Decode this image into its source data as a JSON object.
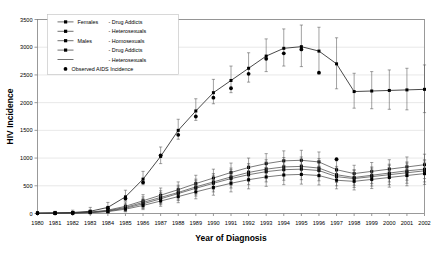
{
  "chart_data": {
    "type": "line",
    "title": "",
    "xlabel": "Year of Diagnosis",
    "ylabel": "HIV Incidence",
    "xlim": [
      1980,
      2002
    ],
    "ylim": [
      0,
      3500
    ],
    "ytick_labels": [
      "0",
      "500",
      "1000",
      "1500",
      "2000",
      "2500",
      "3000",
      "3500"
    ],
    "yticks": [
      0,
      500,
      1000,
      1500,
      2000,
      2500,
      3000,
      3500
    ],
    "grid": true,
    "legend_position": "top-left",
    "categories": [
      1980,
      1981,
      1982,
      1983,
      1984,
      1985,
      1986,
      1987,
      1988,
      1989,
      1990,
      1991,
      1992,
      1993,
      1994,
      1995,
      1996,
      1997,
      1998,
      1999,
      2000,
      2001,
      2002
    ],
    "series": [
      {
        "name": "Females - Drug Addicts",
        "marker": "filled-square",
        "values": [
          5,
          8,
          12,
          25,
          60,
          130,
          230,
          330,
          430,
          540,
          640,
          740,
          830,
          900,
          950,
          960,
          930,
          790,
          720,
          760,
          800,
          840,
          880
        ],
        "err_low": [
          0,
          0,
          0,
          0,
          20,
          55,
          120,
          210,
          300,
          400,
          490,
          580,
          660,
          730,
          780,
          790,
          760,
          640,
          580,
          610,
          640,
          670,
          700
        ],
        "err_high": [
          20,
          25,
          35,
          60,
          110,
          210,
          340,
          460,
          570,
          690,
          800,
          910,
          1000,
          1080,
          1130,
          1140,
          1110,
          950,
          870,
          920,
          970,
          1020,
          1070
        ]
      },
      {
        "name": "Females - Heterosexuals",
        "marker": "filled-square",
        "values": [
          4,
          7,
          10,
          20,
          50,
          110,
          200,
          290,
          380,
          480,
          570,
          660,
          740,
          800,
          840,
          850,
          820,
          700,
          650,
          690,
          730,
          770,
          800
        ],
        "err_low": [
          0,
          0,
          0,
          0,
          15,
          45,
          105,
          180,
          260,
          350,
          430,
          510,
          580,
          640,
          680,
          690,
          660,
          560,
          510,
          540,
          570,
          600,
          630
        ],
        "err_high": [
          18,
          22,
          30,
          52,
          95,
          185,
          300,
          410,
          510,
          620,
          720,
          820,
          900,
          970,
          1010,
          1020,
          990,
          850,
          790,
          840,
          890,
          930,
          970
        ]
      },
      {
        "name": "Males - Homosexuals",
        "marker": "filled-square",
        "values": [
          6,
          10,
          18,
          40,
          110,
          300,
          620,
          1030,
          1500,
          1850,
          2180,
          2400,
          2620,
          2840,
          2980,
          3010,
          2930,
          2700,
          2200,
          2210,
          2220,
          2230,
          2240
        ],
        "err_low": [
          0,
          0,
          0,
          10,
          70,
          230,
          520,
          900,
          1340,
          1680,
          1980,
          2180,
          2370,
          2560,
          2660,
          2650,
          2520,
          2250,
          1900,
          1890,
          1880,
          1870,
          1820
        ],
        "err_high": [
          30,
          40,
          60,
          110,
          200,
          420,
          760,
          1200,
          1700,
          2070,
          2420,
          2660,
          2900,
          3150,
          3330,
          3400,
          3360,
          3170,
          2530,
          2560,
          2590,
          2620,
          2680
        ]
      },
      {
        "name": "Males - Drug Addicts",
        "marker": "filled-square",
        "values": [
          3,
          5,
          9,
          18,
          42,
          95,
          175,
          265,
          360,
          455,
          545,
          630,
          700,
          755,
          790,
          800,
          775,
          665,
          630,
          665,
          700,
          735,
          770
        ],
        "err_low": [
          0,
          0,
          0,
          0,
          12,
          40,
          90,
          160,
          235,
          315,
          390,
          460,
          520,
          570,
          600,
          610,
          590,
          500,
          470,
          495,
          520,
          545,
          570
        ],
        "err_high": [
          15,
          20,
          28,
          45,
          85,
          160,
          265,
          375,
          480,
          590,
          690,
          790,
          870,
          930,
          970,
          980,
          950,
          820,
          780,
          820,
          870,
          910,
          950
        ]
      },
      {
        "name": "Males - Heterosexuals",
        "marker": "filled-square",
        "values": [
          2,
          4,
          7,
          14,
          34,
          78,
          145,
          225,
          305,
          390,
          470,
          545,
          610,
          660,
          695,
          705,
          685,
          600,
          580,
          615,
          650,
          685,
          720
        ],
        "err_low": [
          0,
          0,
          0,
          0,
          8,
          30,
          70,
          130,
          195,
          265,
          330,
          390,
          445,
          490,
          520,
          530,
          515,
          445,
          425,
          450,
          475,
          500,
          525
        ],
        "err_high": [
          12,
          16,
          24,
          38,
          72,
          135,
          225,
          320,
          420,
          515,
          610,
          700,
          775,
          830,
          870,
          880,
          855,
          755,
          735,
          780,
          825,
          870,
          915
        ]
      }
    ],
    "observed": {
      "name": "Observed AIDS Incidence",
      "marker": "filled-circle",
      "x": [
        1980,
        1981,
        1982,
        1983,
        1984,
        1985,
        1986,
        1987,
        1988,
        1989,
        1990,
        1991,
        1992,
        1993,
        1994,
        1995,
        1996,
        1997
      ],
      "values": [
        5,
        8,
        14,
        30,
        95,
        270,
        560,
        1050,
        1420,
        1750,
        2090,
        2260,
        2520,
        2790,
        2890,
        2960,
        2540,
        980
      ]
    }
  },
  "legend": {
    "entries": [
      {
        "group": "Females",
        "label": "Drug Addicts",
        "sym": "line-square"
      },
      {
        "group": "",
        "label": "Heterosexuals",
        "sym": "line-square"
      },
      {
        "group": "Males",
        "label": "Homosexuals",
        "sym": "line-square"
      },
      {
        "group": "",
        "label": "Drug Addicts",
        "sym": "line-square"
      },
      {
        "group": "",
        "label": "Heterosexuals",
        "sym": "line-plain"
      },
      {
        "group": "",
        "label": "Observed AIDS Incidence",
        "sym": "dot"
      }
    ]
  },
  "colors": {
    "line": "#404040",
    "marker": "#000000",
    "grid": "#d9d9d9",
    "axis": "#808080",
    "background": "#ffffff"
  }
}
